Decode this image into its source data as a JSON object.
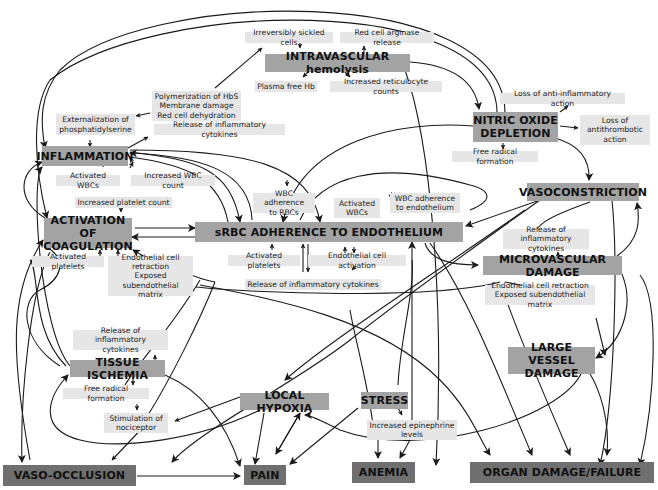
{
  "colors": {
    "major_box": "#a3a3a3",
    "outcome_box": "#6f6f6f",
    "minor_box": "#e6e6e6",
    "line": "#1a1a1a",
    "background": "#ffffff"
  },
  "major_nodes": {
    "intravascular_hemolysis": "INTRAVASCULAR hemolysis",
    "nitric_oxide_depletion": "NITRIC OXIDE\nDEPLETION",
    "inflammation": "INFLAMMATION",
    "activation_of_coagulation": "ACTIVATION OF\nCOAGULATION",
    "srbc_adherence": "sRBC ADHERENCE TO ENDOTHELIUM",
    "vasoconstriction": "VASOCONSTRICTION",
    "microvascular_damage": "MICROVASCULAR DAMAGE",
    "large_vessel_damage": "LARGE VESSEL\nDAMAGE",
    "tissue_ischemia": "TISSUE ISCHEMIA",
    "local_hypoxia": "LOCAL HYPOXIA",
    "stress": "STRESS"
  },
  "outcome_nodes": {
    "vaso_occlusion": "VASO-OCCLUSION",
    "pain": "PAIN",
    "anemia": "ANEMIA",
    "organ_damage": "ORGAN DAMAGE/FAILURE"
  },
  "minor_nodes": {
    "irreversibly_sickled_cells": "Irreversibly sickled cells",
    "red_cell_arginase_release": "Red cell arginase release",
    "plasma_free_hb": "Plasma free Hb",
    "increased_reticulocyte_counts": "Increased reticulocyte counts",
    "polymerization_hbs": "Polymerization of HbS\nMembrane damage\nRed cell dehydration",
    "externalization_ps": "Externalization of\nphosphatidylserine",
    "release_cytokines_top": "Release of inflammatory cytokines",
    "loss_anti_inflammatory": "Loss of anti-inflammatory action",
    "loss_antithrombotic": "Loss of\nantithrombotic\naction",
    "free_radical_no": "Free radical formation",
    "activated_wbcs_left": "Activated WBCs",
    "increased_wbc_count": "Increased WBC count",
    "increased_platelet_count": "Increased platelet count",
    "wbc_adherence_rbcs": "WBC adherence\nto RBCs",
    "activated_wbcs_center": "Activated\nWBCs",
    "wbc_adherence_endothelium": "WBC adherence\nto endothelium",
    "activated_platelets_left": "Activated platelets",
    "endothelial_retraction_left": "Endothelial cell\nretraction\nExposed\nsubendothelial matrix",
    "activated_platelets_center": "Activated platelets",
    "endothelial_cell_activation": "Endothelial cell activation",
    "release_cytokines_center": "Release of inflammatory cytokines",
    "release_cytokines_right": "Release of inflammatory\ncytokines",
    "endothelial_retraction_right": "Endothelial cell retraction\nExposed subendothelial matrix",
    "release_cytokines_ischemia": "Release of inflammatory\ncytokines",
    "free_radical_ischemia": "Free radical formation",
    "stimulation_nociceptor": "Stimulation of\nnociceptor",
    "increased_epinephrine": "Increased epinephrine\nlevels"
  }
}
